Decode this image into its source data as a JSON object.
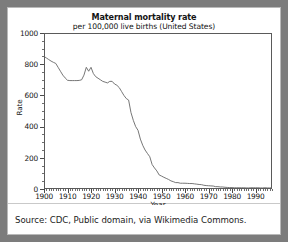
{
  "caption": {
    "text": "Source: CDC, Public domain, via Wikimedia Commons."
  },
  "colors": {
    "outer_border": "#7c7c7c",
    "card_background": "#ffffff",
    "line": "#666666",
    "axis": "#5a5a5a",
    "text": "#161616"
  },
  "chart_data": {
    "type": "line",
    "title": "Maternal mortality rate",
    "subtitle": "per 100,000 live births (United States)",
    "xlabel": "Year",
    "ylabel": "Rate",
    "xlim": [
      1900,
      1997
    ],
    "ylim": [
      0,
      1000
    ],
    "grid": false,
    "legend": "none",
    "x_ticks": [
      1900,
      1910,
      1920,
      1930,
      1940,
      1950,
      1960,
      1970,
      1980,
      1990
    ],
    "y_ticks": [
      0,
      200,
      400,
      600,
      800,
      1000
    ],
    "x_tick_labels": [
      "1900",
      "1910",
      "1920",
      "1930",
      "1940",
      "1950",
      "1960",
      "1970",
      "1980",
      "1990"
    ],
    "y_tick_labels": [
      "0",
      "200",
      "400",
      "600",
      "800",
      "1000"
    ],
    "x_minor_tick_step": 1,
    "y_minor_tick_step": 50,
    "series": [
      {
        "name": "Maternal mortality rate",
        "color": "#666666",
        "x": [
          1900,
          1901,
          1902,
          1903,
          1904,
          1905,
          1906,
          1907,
          1908,
          1909,
          1910,
          1911,
          1912,
          1913,
          1914,
          1915,
          1916,
          1917,
          1918,
          1919,
          1920,
          1921,
          1922,
          1923,
          1924,
          1925,
          1926,
          1927,
          1928,
          1929,
          1930,
          1931,
          1932,
          1933,
          1934,
          1935,
          1936,
          1937,
          1938,
          1939,
          1940,
          1941,
          1942,
          1943,
          1944,
          1945,
          1946,
          1947,
          1948,
          1949,
          1950,
          1951,
          1952,
          1953,
          1954,
          1955,
          1956,
          1957,
          1958,
          1959,
          1960,
          1961,
          1962,
          1963,
          1964,
          1965,
          1966,
          1967,
          1968,
          1969,
          1970,
          1971,
          1972,
          1973,
          1974,
          1975,
          1976,
          1977,
          1978,
          1979,
          1980,
          1981,
          1982,
          1983,
          1984,
          1985,
          1986,
          1987,
          1988,
          1989,
          1990,
          1991,
          1992,
          1993,
          1994,
          1995,
          1996,
          1997
        ],
        "values": [
          850,
          840,
          830,
          820,
          812,
          805,
          780,
          755,
          730,
          712,
          697,
          695,
          695,
          695,
          695,
          696,
          700,
          730,
          780,
          755,
          780,
          740,
          720,
          710,
          700,
          690,
          685,
          680,
          690,
          690,
          673,
          665,
          650,
          625,
          600,
          580,
          570,
          490,
          440,
          400,
          376,
          320,
          280,
          250,
          228,
          207,
          157,
          135,
          116,
          90,
          83,
          75,
          68,
          61,
          52,
          47,
          41,
          41,
          37,
          37,
          37,
          36,
          35,
          35,
          33,
          31,
          29,
          28,
          24,
          22,
          21,
          20,
          19,
          15,
          15,
          13,
          13,
          11,
          10,
          9,
          9,
          8,
          8,
          8,
          8,
          8,
          7,
          7,
          8,
          8,
          8,
          8,
          7,
          7,
          8,
          7,
          7,
          8
        ]
      }
    ]
  }
}
